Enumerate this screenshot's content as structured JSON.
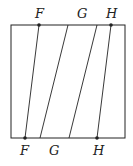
{
  "diagram": {
    "stroke_color": "#222222",
    "top_labels": [
      "F",
      "G",
      "H"
    ],
    "bottom_labels": [
      "F",
      "G",
      "H"
    ],
    "segments": [
      {
        "name": "F-segment",
        "top_label": "F",
        "bottom_label": "F",
        "top_dot": true,
        "bottom_dot": true
      },
      {
        "name": "G-segment-1",
        "top_label": "G",
        "bottom_label": "G",
        "top_dot": false,
        "bottom_dot": false
      },
      {
        "name": "G-segment-2",
        "top_label": "",
        "bottom_label": "",
        "top_dot": false,
        "bottom_dot": false
      },
      {
        "name": "H-segment",
        "top_label": "H",
        "bottom_label": "H",
        "top_dot": true,
        "bottom_dot": true
      }
    ]
  }
}
